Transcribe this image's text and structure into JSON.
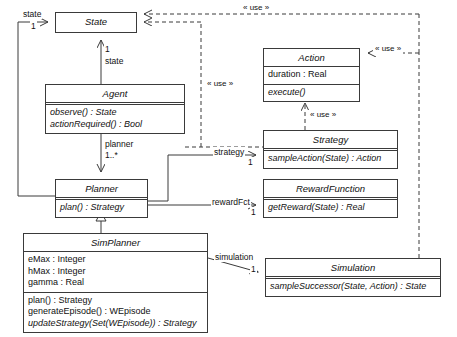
{
  "diagram": {
    "type": "uml-class-diagram",
    "width": 457,
    "height": 337,
    "background": "#ffffff",
    "line_color": "#3a3a3a",
    "text_color": "#111111"
  },
  "classes": {
    "state": {
      "name": "State",
      "abstract": true,
      "attributes": [],
      "operations": [],
      "box": {
        "x": 55,
        "y": 12,
        "w": 82,
        "h": 21
      }
    },
    "agent": {
      "name": "Agent",
      "abstract": true,
      "attributes": [],
      "operations": [
        "observe() : State",
        "actionRequired() : Bool"
      ],
      "box": {
        "x": 45,
        "y": 84,
        "w": 140,
        "h": 48
      }
    },
    "planner": {
      "name": "Planner",
      "abstract": true,
      "attributes": [],
      "operations": [
        "plan() : Strategy"
      ],
      "box": {
        "x": 55,
        "y": 179,
        "w": 93,
        "h": 33
      }
    },
    "sim_planner": {
      "name": "SimPlanner",
      "abstract": true,
      "attributes": [
        "eMax : Integer",
        "hMax : Integer",
        "gamma : Real"
      ],
      "operations": [
        "plan() : Strategy",
        "generateEpisode() : WEpisode",
        "updateStrategy(Set(WEpisode)) : Strategy"
      ],
      "box": {
        "x": 23,
        "y": 233,
        "w": 185,
        "h": 85
      }
    },
    "action": {
      "name": "Action",
      "abstract": true,
      "attributes": [
        "duration : Real"
      ],
      "operations": [
        "execute()"
      ],
      "box": {
        "x": 263,
        "y": 48,
        "w": 97,
        "h": 47
      }
    },
    "strategy": {
      "name": "Strategy",
      "abstract": true,
      "attributes": [],
      "operations": [
        "sampleAction(State) : Action"
      ],
      "box": {
        "x": 263,
        "y": 130,
        "w": 135,
        "h": 33
      }
    },
    "reward_function": {
      "name": "RewardFunction",
      "abstract": true,
      "attributes": [],
      "operations": [
        "getReward(State) : Real"
      ],
      "box": {
        "x": 263,
        "y": 179,
        "w": 135,
        "h": 33
      }
    },
    "simulation": {
      "name": "Simulation",
      "abstract": true,
      "attributes": [],
      "operations": [
        "sampleSuccessor(State, Action) : State"
      ],
      "box": {
        "x": 265,
        "y": 258,
        "w": 176,
        "h": 33
      }
    }
  },
  "labels": {
    "state_role_left": "state",
    "state_mult_left": "1",
    "state_role_agent": "state",
    "state_mult_agent": "1",
    "planner_role": "planner",
    "planner_mult": "1..*",
    "strategy_role": "strategy",
    "strategy_mult": "1",
    "reward_role": "rewardFct",
    "reward_mult": "1",
    "simulation_role": "simulation",
    "simulation_mult": "1",
    "use_top": "« use »",
    "use_left": "« use »",
    "use_action_right": "« use »",
    "use_strategy_action": "« use »"
  }
}
